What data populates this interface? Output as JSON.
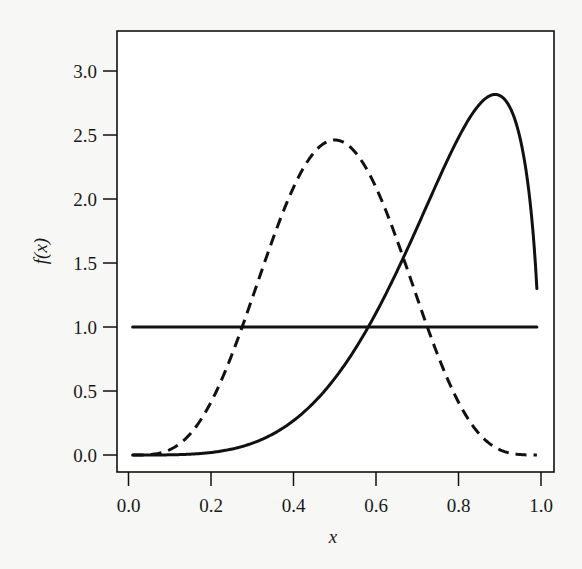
{
  "chart_data": {
    "type": "line",
    "title": "",
    "xlabel": "x",
    "ylabel": "f(x)",
    "xlim": [
      -0.03,
      1.03
    ],
    "ylim": [
      -0.13,
      3.32
    ],
    "grid": false,
    "legend": null,
    "x_ticks": [
      0.0,
      0.2,
      0.4,
      0.6,
      0.8,
      1.0
    ],
    "x_tick_labels": [
      "0.0",
      "0.2",
      "0.4",
      "0.6",
      "0.8",
      "1.0"
    ],
    "y_ticks": [
      0.0,
      0.5,
      1.0,
      1.5,
      2.0,
      2.5,
      3.0
    ],
    "y_tick_labels": [
      "0.0",
      "0.5",
      "1.0",
      "1.5",
      "2.0",
      "2.5",
      "3.0"
    ],
    "series": [
      {
        "name": "Uniform(0,1)",
        "style": "solid",
        "distribution": {
          "kind": "beta",
          "a": 1,
          "b": 1
        },
        "x": [
          0.01,
          0.99
        ],
        "values": [
          1.0,
          1.0
        ]
      },
      {
        "name": "Beta(5,5)",
        "style": "dashed",
        "distribution": {
          "kind": "beta",
          "a": 5,
          "b": 5
        },
        "x": [
          0.01,
          0.1,
          0.2,
          0.3,
          0.4,
          0.5,
          0.6,
          0.7,
          0.8,
          0.9,
          0.99
        ],
        "values": [
          0.0,
          0.04,
          0.41,
          1.22,
          2.07,
          2.46,
          2.07,
          1.22,
          0.41,
          0.04,
          0.0
        ]
      },
      {
        "name": "Beta(5,1.5)",
        "style": "solid",
        "distribution": {
          "kind": "beta",
          "a": 5,
          "b": 1.5
        },
        "x": [
          0.01,
          0.1,
          0.2,
          0.3,
          0.4,
          0.5,
          0.6,
          0.7,
          0.8,
          0.9,
          0.95,
          0.99
        ],
        "values": [
          0.0,
          0.004,
          0.02,
          0.1,
          0.27,
          0.6,
          1.08,
          1.7,
          2.48,
          2.81,
          2.48,
          1.3
        ]
      }
    ]
  },
  "colors": {
    "ink": "#111111",
    "background": "#f7f7f5"
  }
}
